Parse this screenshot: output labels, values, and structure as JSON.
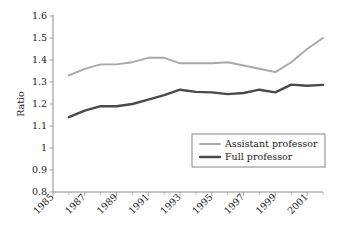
{
  "chart_data": {
    "type": "line",
    "title": "",
    "xlabel": "",
    "ylabel": "Ratio",
    "xlim": [
      1985,
      2002
    ],
    "ylim": [
      0.8,
      1.6
    ],
    "grid": false,
    "legend_position": "lower-right",
    "x": [
      1986,
      1987,
      1988,
      1989,
      1990,
      1991,
      1992,
      1993,
      1994,
      1995,
      1996,
      1997,
      1998,
      1999,
      2000,
      2001,
      2002
    ],
    "xtick_labels": [
      "1985",
      "1987",
      "1989",
      "1991",
      "1993",
      "1995",
      "1997",
      "1999",
      "2001"
    ],
    "xtick_values": [
      1985,
      1987,
      1989,
      1991,
      1993,
      1995,
      1997,
      1999,
      2001
    ],
    "xtick_minor_values": [
      1986,
      1988,
      1990,
      1992,
      1994,
      1996,
      1998,
      2000,
      2002
    ],
    "ytick_labels": [
      "0.8",
      "0.9",
      "1",
      "1.1",
      "1.2",
      "1.3",
      "1.4",
      "1.5",
      "1.6"
    ],
    "ytick_values": [
      0.8,
      0.9,
      1.0,
      1.1,
      1.2,
      1.3,
      1.4,
      1.5,
      1.6
    ],
    "series": [
      {
        "name": "Assistant professor",
        "color": "#a8a8a8",
        "width": 1.9,
        "values": [
          1.33,
          1.36,
          1.38,
          1.38,
          1.39,
          1.41,
          1.41,
          1.385,
          1.385,
          1.385,
          1.39,
          1.375,
          1.36,
          1.345,
          1.39,
          1.45,
          1.5
        ]
      },
      {
        "name": "Full professor",
        "color": "#4a4a4a",
        "width": 2.4,
        "values": [
          1.14,
          1.17,
          1.19,
          1.19,
          1.2,
          1.22,
          1.24,
          1.265,
          1.255,
          1.253,
          1.245,
          1.25,
          1.265,
          1.253,
          1.288,
          1.283,
          1.287
        ]
      }
    ]
  },
  "legend": {
    "entries": [
      {
        "label": "Assistant professor"
      },
      {
        "label": "Full professor"
      }
    ]
  }
}
